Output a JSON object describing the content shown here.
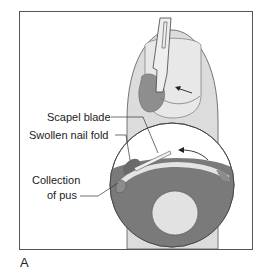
{
  "figure": {
    "panel_letter": "A",
    "labels": {
      "scalpel_blade": "Scapel blade",
      "swollen_nail_fold": "Swollen nail fold",
      "collection_line1": "Collection",
      "collection_line2": "of pus"
    },
    "colors": {
      "skin": "#d9d9d9",
      "nail": "#e6e6e6",
      "pus": "#8c8c8c",
      "dark_tissue": "#7a7a7a",
      "outline": "#444444"
    }
  }
}
